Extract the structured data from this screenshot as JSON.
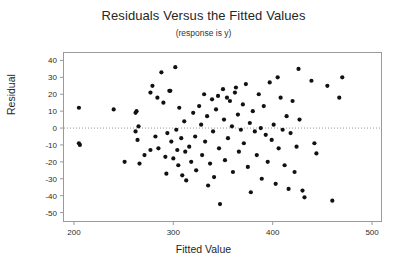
{
  "chart_data": {
    "type": "scatter",
    "title": "Residuals Versus the Fitted Values",
    "subtitle": "(response is y)",
    "xlabel": "Fitted Value",
    "ylabel": "Residual",
    "xlim": [
      190,
      510
    ],
    "ylim": [
      -55,
      45
    ],
    "xticks": [
      200,
      300,
      400,
      500
    ],
    "yticks": [
      40,
      30,
      20,
      10,
      0,
      -10,
      -20,
      -30,
      -40,
      -50
    ],
    "grid": false,
    "legend": null,
    "reference_line": {
      "orientation": "horizontal",
      "y": 0,
      "style": "dotted"
    },
    "marker": {
      "shape": "circle",
      "color": "#111111",
      "size": 2.1
    },
    "points": [
      [
        205,
        12
      ],
      [
        205,
        -9
      ],
      [
        206,
        -10
      ],
      [
        240,
        11
      ],
      [
        251,
        -20
      ],
      [
        262,
        9
      ],
      [
        262,
        -2
      ],
      [
        263,
        10
      ],
      [
        264,
        -7
      ],
      [
        265,
        1
      ],
      [
        266,
        -21
      ],
      [
        271,
        -16
      ],
      [
        277,
        21
      ],
      [
        277,
        -13
      ],
      [
        279,
        25
      ],
      [
        282,
        -5
      ],
      [
        284,
        18
      ],
      [
        285,
        -12
      ],
      [
        288,
        33
      ],
      [
        290,
        15
      ],
      [
        292,
        -17
      ],
      [
        293,
        -27
      ],
      [
        294,
        -3
      ],
      [
        296,
        22
      ],
      [
        297,
        22
      ],
      [
        298,
        -8
      ],
      [
        300,
        -18
      ],
      [
        302,
        36
      ],
      [
        303,
        -1
      ],
      [
        304,
        -13
      ],
      [
        305,
        -22
      ],
      [
        306,
        12
      ],
      [
        308,
        -6
      ],
      [
        309,
        -28
      ],
      [
        311,
        4
      ],
      [
        312,
        -14
      ],
      [
        313,
        -31
      ],
      [
        316,
        -11
      ],
      [
        318,
        -20
      ],
      [
        320,
        9
      ],
      [
        322,
        -5
      ],
      [
        323,
        -25
      ],
      [
        326,
        13
      ],
      [
        328,
        2
      ],
      [
        329,
        -16
      ],
      [
        331,
        20
      ],
      [
        332,
        -8
      ],
      [
        334,
        7
      ],
      [
        335,
        -34
      ],
      [
        337,
        -21
      ],
      [
        339,
        17
      ],
      [
        340,
        -2
      ],
      [
        341,
        -29
      ],
      [
        343,
        11
      ],
      [
        345,
        19
      ],
      [
        346,
        -12
      ],
      [
        347,
        -45
      ],
      [
        350,
        23
      ],
      [
        351,
        5
      ],
      [
        352,
        -19
      ],
      [
        354,
        18
      ],
      [
        355,
        -6
      ],
      [
        357,
        16
      ],
      [
        359,
        1
      ],
      [
        360,
        -26
      ],
      [
        362,
        21
      ],
      [
        363,
        24
      ],
      [
        365,
        8
      ],
      [
        366,
        -14
      ],
      [
        368,
        -1
      ],
      [
        370,
        14
      ],
      [
        371,
        -9
      ],
      [
        373,
        26
      ],
      [
        375,
        -23
      ],
      [
        377,
        3
      ],
      [
        378,
        -38
      ],
      [
        380,
        10
      ],
      [
        382,
        -2
      ],
      [
        384,
        -16
      ],
      [
        386,
        20
      ],
      [
        388,
        0
      ],
      [
        389,
        -30
      ],
      [
        391,
        13
      ],
      [
        393,
        -4
      ],
      [
        395,
        -20
      ],
      [
        397,
        27
      ],
      [
        399,
        -7
      ],
      [
        401,
        2
      ],
      [
        403,
        -33
      ],
      [
        405,
        30
      ],
      [
        406,
        -12
      ],
      [
        408,
        18
      ],
      [
        410,
        -1
      ],
      [
        412,
        -22
      ],
      [
        414,
        7
      ],
      [
        416,
        -36
      ],
      [
        418,
        -3
      ],
      [
        420,
        16
      ],
      [
        422,
        -26
      ],
      [
        424,
        -11
      ],
      [
        426,
        35
      ],
      [
        427,
        5
      ],
      [
        430,
        -37
      ],
      [
        432,
        -41
      ],
      [
        439,
        28
      ],
      [
        442,
        -9
      ],
      [
        444,
        -15
      ],
      [
        455,
        25
      ],
      [
        460,
        -43
      ],
      [
        467,
        18
      ],
      [
        470,
        30
      ]
    ]
  }
}
